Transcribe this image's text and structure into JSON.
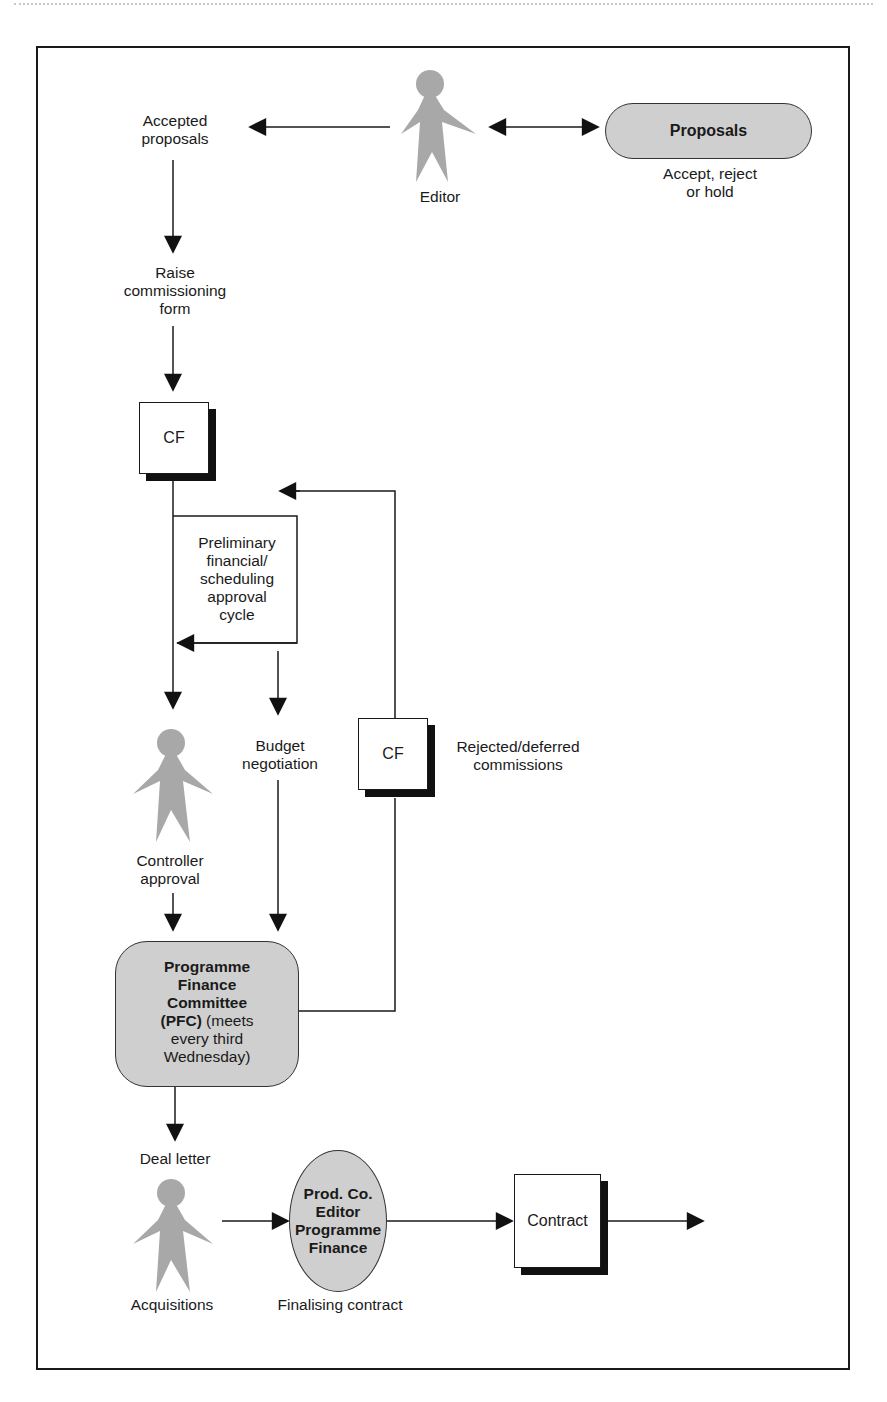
{
  "diagram": {
    "top_label": {
      "accepted_proposals": [
        "Accepted",
        "proposals"
      ],
      "editor": "Editor",
      "proposals": "Proposals",
      "proposals_note": [
        "Accept, reject",
        "or hold"
      ]
    },
    "steps": {
      "raise_form": [
        "Raise",
        "commissioning",
        "form"
      ],
      "cf_1": "CF",
      "preliminary_cycle": [
        "Preliminary",
        "financial/",
        "scheduling",
        "approval",
        "cycle"
      ],
      "budget_negotiation": [
        "Budget",
        "negotiation"
      ],
      "cf_2": "CF",
      "rejected_deferred": [
        "Rejected/deferred",
        "commissions"
      ],
      "controller_approval": [
        "Controller",
        "approval"
      ],
      "pfc": {
        "bold_lines": [
          "Programme",
          "Finance",
          "Committee"
        ],
        "bold_prefix": "(PFC)",
        "rest_1": " (meets",
        "rest_2": "every third",
        "rest_3": "Wednesday)"
      },
      "deal_letter": "Deal letter",
      "acquisitions": "Acquisitions",
      "prod_co": [
        "Prod. Co.",
        "Editor",
        "Programme",
        "Finance"
      ],
      "finalising_contract": "Finalising contract",
      "contract": "Contract"
    },
    "colors": {
      "figure_gray": "#a8a8a8",
      "shape_fill": "#cfcfcf",
      "line": "#1a1a1a"
    }
  }
}
